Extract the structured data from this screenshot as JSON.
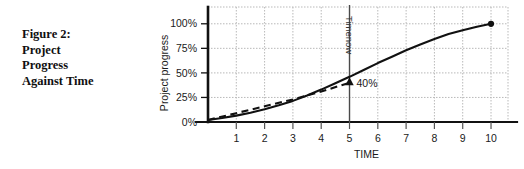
{
  "caption": {
    "lines": [
      "Figure 2:",
      "Project",
      "Progress",
      "Against Time"
    ]
  },
  "colors": {
    "axis": "#111111",
    "curve": "#111111",
    "grid": "#b9b9b9",
    "timenow": "#4a4a4a",
    "text": "#1a1a1a"
  },
  "chart_data": {
    "type": "line",
    "title": "Figure 2: Project Progress Against Time",
    "xlabel": "TIME",
    "ylabel": "Project progress",
    "xlim": [
      0,
      10.6
    ],
    "ylim": [
      0,
      112
    ],
    "grid": true,
    "legend": "none",
    "x_ticks": [
      1,
      2,
      3,
      4,
      5,
      6,
      7,
      8,
      9,
      10
    ],
    "x_tick_labels": [
      "1",
      "2",
      "3",
      "4",
      "5",
      "6",
      "7",
      "8",
      "9",
      "10"
    ],
    "y_ticks": [
      0,
      25,
      50,
      75,
      100
    ],
    "y_tick_labels": [
      "0%",
      "25%",
      "50%",
      "75%",
      "100%"
    ],
    "series": [
      {
        "name": "Actual progress",
        "style": "solid",
        "x": [
          0,
          0.5,
          1,
          1.5,
          2,
          2.5,
          3,
          3.5,
          4,
          4.5,
          5,
          5.5,
          6,
          6.5,
          7,
          7.5,
          8,
          8.5,
          9,
          9.5,
          10
        ],
        "values": [
          2,
          4,
          6.5,
          9.5,
          13,
          17,
          21.5,
          27,
          33,
          39.5,
          46,
          53,
          60,
          66.5,
          73,
          79,
          84.5,
          89.5,
          93.5,
          97,
          100
        ],
        "end_marker": {
          "x": 10,
          "y": 100,
          "shape": "filled-circle"
        }
      },
      {
        "name": "Planned progress",
        "style": "dashed",
        "x": [
          0,
          1,
          2,
          3,
          4,
          5
        ],
        "values": [
          2,
          9,
          16,
          23,
          31,
          40
        ],
        "end_marker": {
          "x": 5,
          "y": 40,
          "shape": "filled-arrow-up"
        }
      }
    ],
    "annotations": [
      {
        "name": "progress-callout",
        "text": "40%",
        "x": 5,
        "y": 40
      },
      {
        "name": "timenow-line",
        "text": "Timenow",
        "x": 5,
        "orientation": "vertical",
        "rotation": 90
      }
    ]
  }
}
